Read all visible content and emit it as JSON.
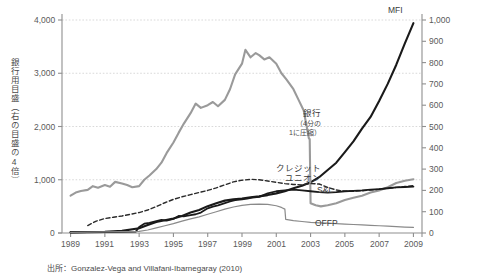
{
  "chart_data": {
    "type": "line",
    "title": "",
    "subtitle": "",
    "xlabel": "",
    "ylabel": "銀行用目盛（右の目盛の4倍）",
    "ylabel_right": "",
    "grid": true,
    "legend_position": "right-inline",
    "xlim": [
      1988.5,
      2009.5
    ],
    "ylim_left": [
      0,
      4000
    ],
    "ylim_right": [
      0,
      1000
    ],
    "xticks": [
      "1989",
      "1991",
      "1993",
      "1995",
      "1997",
      "1999",
      "2001",
      "2003",
      "2005",
      "2007",
      "2009"
    ],
    "xtick_values": [
      1989,
      1991,
      1993,
      1995,
      1997,
      1999,
      2001,
      2003,
      2005,
      2007,
      2009
    ],
    "yticks_left": [
      "0",
      "1,000",
      "2,000",
      "3,000",
      "4,000"
    ],
    "ytick_values_left": [
      0,
      1000,
      2000,
      3000,
      4000
    ],
    "yticks_right": [
      "0",
      "100",
      "200",
      "300",
      "400",
      "500",
      "600",
      "700",
      "800",
      "900",
      "1,000"
    ],
    "ytick_values_right": [
      0,
      100,
      200,
      300,
      400,
      500,
      600,
      700,
      800,
      900,
      1000
    ],
    "gridline_values_left": [
      1000,
      2000,
      3000,
      4000
    ],
    "source_note": "出所：Gonzalez-Vega and Villafani-Ibarnegaray (2010)",
    "series": [
      {
        "name": "MFI",
        "label": "MFI",
        "axis": "right",
        "color": "#1a1a1a",
        "style": "solid",
        "width": 2.1,
        "label_x": 2008.4,
        "label_y": 1040,
        "x": [
          1989.0,
          1990.0,
          1991.0,
          1992.0,
          1993.0,
          1993.5,
          1994.0,
          1994.5,
          1995.0,
          1995.5,
          1996.0,
          1996.5,
          1997.0,
          1997.5,
          1998.0,
          1998.5,
          1999.0,
          1999.5,
          2000.0,
          2000.5,
          2001.0,
          2001.5,
          2002.0,
          2002.5,
          2003.0,
          2003.5,
          2004.0,
          2004.5,
          2005.0,
          2005.5,
          2006.0,
          2006.5,
          2007.0,
          2007.5,
          2008.0,
          2008.5,
          2009.0
        ],
        "y": [
          4,
          5,
          6,
          10,
          22,
          38,
          52,
          60,
          68,
          80,
          96,
          108,
          126,
          140,
          152,
          158,
          162,
          168,
          172,
          178,
          186,
          196,
          210,
          222,
          238,
          262,
          296,
          330,
          380,
          430,
          490,
          545,
          620,
          700,
          790,
          890,
          985
        ]
      },
      {
        "name": "銀行",
        "label": "銀行",
        "label_sub": "（4分の\n1に圧縮）",
        "label_sub_line1": "（4分の",
        "label_sub_line2": "1に圧縮）",
        "axis": "left",
        "color": "#9a9a9a",
        "style": "solid",
        "width": 2.1,
        "label_x": 2003.6,
        "label_y": 2060,
        "x": [
          1989.0,
          1989.3,
          1989.6,
          1990.0,
          1990.3,
          1990.6,
          1991.0,
          1991.3,
          1991.6,
          1992.0,
          1992.3,
          1992.6,
          1993.0,
          1993.3,
          1993.6,
          1994.0,
          1994.3,
          1994.6,
          1995.0,
          1995.3,
          1995.6,
          1996.0,
          1996.3,
          1996.6,
          1997.0,
          1997.3,
          1997.6,
          1998.0,
          1998.3,
          1998.6,
          1999.0,
          1999.2,
          1999.5,
          1999.8,
          2000.0,
          2000.3,
          2000.6,
          2001.0,
          2001.3,
          2001.6,
          2002.0,
          2002.3,
          2002.6,
          2002.9,
          2002.95,
          2003.0,
          2003.3,
          2003.6,
          2004.0,
          2004.5,
          2005.0,
          2005.5,
          2006.0,
          2006.5,
          2007.0,
          2007.5,
          2008.0,
          2008.5,
          2009.0
        ],
        "y": [
          700,
          760,
          790,
          810,
          880,
          850,
          900,
          870,
          960,
          930,
          900,
          860,
          880,
          1000,
          1080,
          1200,
          1320,
          1500,
          1700,
          1880,
          2050,
          2250,
          2430,
          2350,
          2400,
          2460,
          2380,
          2500,
          2700,
          2980,
          3180,
          3440,
          3300,
          3380,
          3340,
          3260,
          3300,
          3180,
          3000,
          2880,
          2700,
          2500,
          2300,
          1780,
          1760,
          560,
          520,
          500,
          520,
          560,
          620,
          660,
          700,
          760,
          800,
          860,
          940,
          980,
          1010
        ]
      },
      {
        "name": "クレジットユニオン",
        "label": "クレジット",
        "label_line2": "ユニオン",
        "axis": "right",
        "color": "#2a2a2a",
        "style": "dashed",
        "width": 1.4,
        "label_x": 2003.6,
        "label_y": 280,
        "x": [
          1990.0,
          1990.5,
          1991.0,
          1991.5,
          1992.0,
          1992.5,
          1993.0,
          1993.5,
          1994.0,
          1994.5,
          1995.0,
          1995.5,
          1996.0,
          1996.5,
          1997.0,
          1997.5,
          1998.0,
          1998.5,
          1999.0,
          1999.5,
          2000.0,
          2000.5,
          2001.0,
          2001.5,
          2002.0,
          2002.5,
          2003.0,
          2003.5,
          2004.0,
          2004.5,
          2005.0,
          2005.5,
          2006.0,
          2006.5,
          2007.0,
          2007.5,
          2008.0,
          2008.5,
          2009.0
        ],
        "y": [
          35,
          56,
          68,
          74,
          80,
          88,
          96,
          108,
          124,
          142,
          158,
          170,
          180,
          190,
          200,
          212,
          226,
          240,
          248,
          252,
          250,
          244,
          238,
          232,
          228,
          226,
          232,
          230,
          214,
          202,
          196,
          196,
          198,
          202,
          206,
          210,
          214,
          218,
          222
        ]
      },
      {
        "name": "S&L",
        "label": "S&L",
        "axis": "right",
        "color": "#1a1a1a",
        "style": "solid",
        "width": 1.8,
        "label_x": 2004.3,
        "label_y": 196,
        "x": [
          1989.0,
          1990.0,
          1991.0,
          1992.0,
          1992.8,
          1993.0,
          1993.3,
          1993.6,
          1994.0,
          1994.3,
          1994.6,
          1995.0,
          1995.3,
          1995.6,
          1996.0,
          1996.3,
          1996.6,
          1997.0,
          1997.3,
          1997.6,
          1998.0,
          1998.3,
          1998.6,
          1999.0,
          1999.3,
          1999.6,
          2000.0,
          2000.5,
          2001.0,
          2001.5,
          2002.0,
          2002.5,
          2003.0,
          2003.5,
          2004.0,
          2004.5,
          2005.0,
          2005.5,
          2006.0,
          2006.5,
          2007.0,
          2007.5,
          2008.0,
          2008.5,
          2009.0
        ],
        "y": [
          2,
          3,
          4,
          5,
          6,
          28,
          44,
          48,
          56,
          62,
          58,
          66,
          80,
          78,
          84,
          88,
          96,
          116,
          124,
          130,
          140,
          148,
          154,
          158,
          162,
          166,
          170,
          186,
          196,
          200,
          204,
          200,
          196,
          192,
          190,
          192,
          196,
          198,
          200,
          204,
          206,
          210,
          214,
          216,
          218
        ]
      },
      {
        "name": "OFFP",
        "label": "OFFP",
        "axis": "right",
        "color": "#8a8a8a",
        "style": "solid",
        "width": 1.2,
        "label_x": 2004.6,
        "label_y": 44,
        "x": [
          1989.0,
          1990.0,
          1991.0,
          1992.0,
          1993.0,
          1993.5,
          1994.0,
          1994.5,
          1995.0,
          1995.5,
          1996.0,
          1996.5,
          1997.0,
          1997.5,
          1998.0,
          1998.5,
          1999.0,
          1999.5,
          2000.0,
          2000.5,
          2001.0,
          2001.3,
          2001.5,
          2001.55,
          2002.0,
          2002.5,
          2003.0,
          2003.5,
          2004.0,
          2004.5,
          2005.0,
          2005.5,
          2006.0,
          2006.5,
          2007.0,
          2007.5,
          2008.0,
          2008.5,
          2009.0
        ],
        "y": [
          3,
          4,
          5,
          6,
          8,
          14,
          24,
          34,
          44,
          56,
          66,
          76,
          88,
          100,
          112,
          122,
          130,
          134,
          136,
          134,
          128,
          120,
          112,
          64,
          58,
          54,
          50,
          48,
          46,
          44,
          42,
          40,
          38,
          36,
          34,
          32,
          30,
          28,
          26
        ]
      }
    ]
  }
}
